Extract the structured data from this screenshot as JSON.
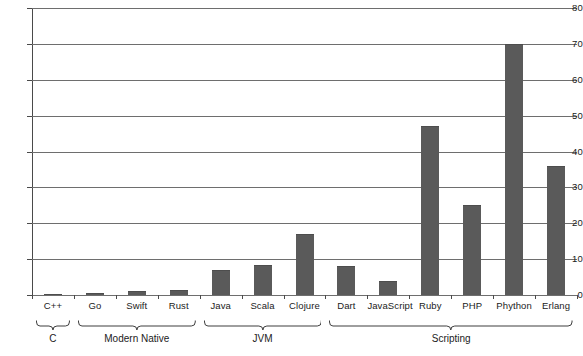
{
  "chart_data": {
    "type": "bar",
    "title": "",
    "subtitle": "",
    "xlabel": "",
    "ylabel": "",
    "ylim": [
      0,
      80
    ],
    "yticks": [
      0,
      10,
      20,
      30,
      40,
      50,
      60,
      70,
      80
    ],
    "grid": true,
    "legend": null,
    "orientation": "vertical",
    "bar_color": "#5a5a5a",
    "axis_color": "#4a4a4a",
    "grid_color": "#6e6e6e",
    "categories": [
      "C++",
      "Go",
      "Swift",
      "Rust",
      "Java",
      "Scala",
      "Clojure",
      "Dart",
      "JavaScript",
      "Ruby",
      "PHP",
      "Phython",
      "Erlang"
    ],
    "values": [
      0.2,
      0.5,
      1.2,
      1.5,
      7,
      8.5,
      17,
      8,
      4,
      47,
      25,
      70,
      36
    ],
    "groups": [
      {
        "label": "C",
        "members": [
          "C++"
        ],
        "start_index": 0,
        "end_index": 0
      },
      {
        "label": "Modern Native",
        "members": [
          "Go",
          "Swift",
          "Rust"
        ],
        "start_index": 1,
        "end_index": 3
      },
      {
        "label": "JVM",
        "members": [
          "Java",
          "Scala",
          "Clojure"
        ],
        "start_index": 4,
        "end_index": 6
      },
      {
        "label": "Scripting",
        "members": [
          "Dart",
          "JavaScript",
          "Ruby",
          "PHP",
          "Phython",
          "Erlang"
        ],
        "start_index": 7,
        "end_index": 12
      }
    ]
  }
}
